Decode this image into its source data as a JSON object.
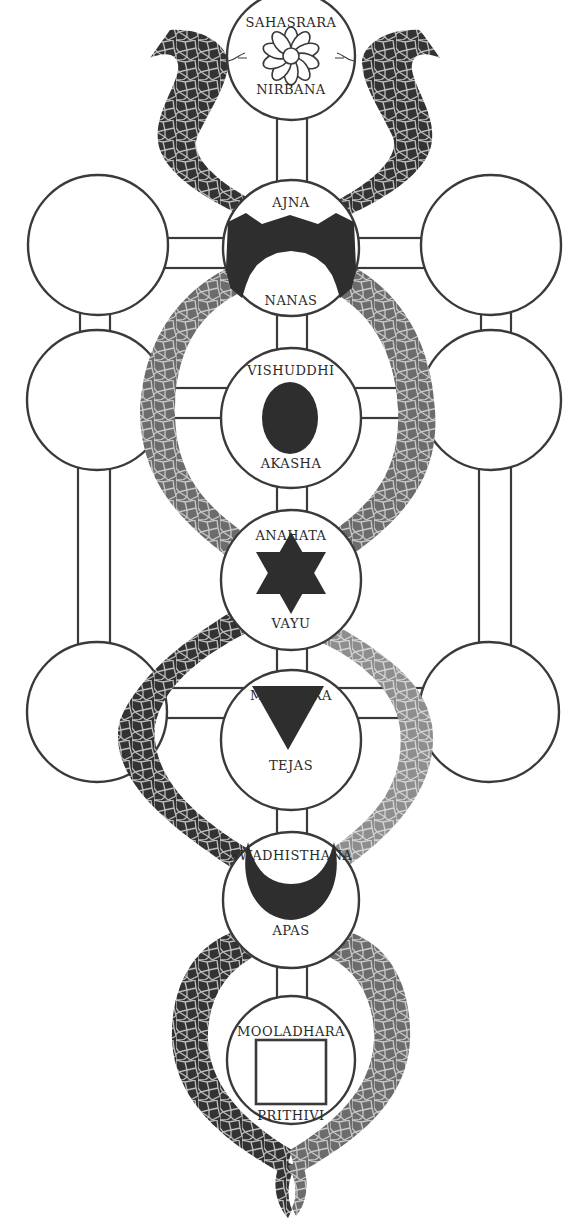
{
  "diagram": {
    "title": "",
    "chakras": [
      {
        "name": "SAHASRARA",
        "element": "NIRBANA",
        "symbol": "lotus-icon",
        "cx": 291,
        "cy": 56,
        "r": 64
      },
      {
        "name": "AJNA",
        "element": "NANAS",
        "symbol": "ajna-mountain-icon",
        "cx": 291,
        "cy": 248,
        "r": 68
      },
      {
        "name": "VISHUDDHI",
        "element": "AKASHA",
        "symbol": "oval-egg-icon",
        "cx": 291,
        "cy": 418,
        "r": 70
      },
      {
        "name": "ANAHATA",
        "element": "VAYU",
        "symbol": "hexagram-star-icon",
        "cx": 291,
        "cy": 580,
        "r": 70
      },
      {
        "name": "MANIPURA",
        "element": "TEJAS",
        "symbol": "down-triangle-icon",
        "cx": 291,
        "cy": 740,
        "r": 70
      },
      {
        "name": "SWADHISTHANA",
        "element": "APAS",
        "symbol": "crescent-moon-icon",
        "cx": 291,
        "cy": 900,
        "r": 68
      },
      {
        "name": "MOOLADHARA",
        "element": "PRITHIVI",
        "symbol": "square-icon",
        "cx": 291,
        "cy": 1060,
        "r": 64
      }
    ],
    "side_circles": {
      "left": [
        {
          "cx": 98,
          "cy": 245,
          "r": 70
        },
        {
          "cx": 97,
          "cy": 400,
          "r": 70
        },
        {
          "cx": 97,
          "cy": 712,
          "r": 70
        }
      ],
      "right": [
        {
          "cx": 491,
          "cy": 245,
          "r": 70
        },
        {
          "cx": 491,
          "cy": 400,
          "r": 70
        },
        {
          "cx": 489,
          "cy": 712,
          "r": 70
        }
      ]
    },
    "snakes": [
      {
        "name": "left-snake",
        "color_dark": "#2f2f2f",
        "color_light": "#8a8a8a"
      },
      {
        "name": "right-snake",
        "color_dark": "#2f2f2f",
        "color_light": "#9a9a9a"
      }
    ],
    "colors": {
      "stroke": "#3a3a3a",
      "fill_dark": "#2e2e2e",
      "background": "#ffffff"
    }
  }
}
